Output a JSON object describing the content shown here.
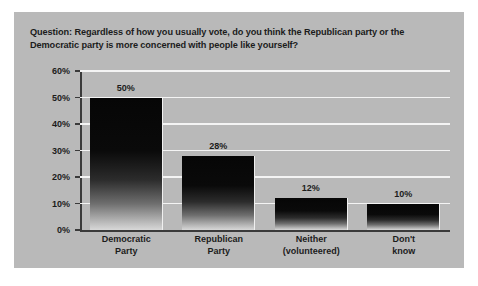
{
  "question": "Question: Regardless of how you usually vote, do you think the Republican party or the Democratic party is more concerned with people like yourself?",
  "colors": {
    "panel_background": "#b9b9b9",
    "gridline": "#f4f4f4",
    "axis": "#3a3a3a",
    "text": "#1c1c1c",
    "bar_top": "#060606",
    "bar_bottom": "#d8d8d8"
  },
  "chart_data": {
    "type": "bar",
    "title": "Question: Regardless of how you usually vote, do you think the Republican party or the Democratic party is more concerned with people like yourself?",
    "xlabel": "",
    "ylabel": "",
    "categories": [
      "Democratic\nParty",
      "Republican\nParty",
      "Neither\n(volunteered)",
      "Don't\nknow"
    ],
    "category_lines": [
      [
        "Democratic",
        "Party"
      ],
      [
        "Republican",
        "Party"
      ],
      [
        "Neither",
        "(volunteered)"
      ],
      [
        "Don't",
        "know"
      ]
    ],
    "values": [
      50,
      28,
      12,
      10
    ],
    "data_labels": [
      "50%",
      "28%",
      "12%",
      "10%"
    ],
    "ylim": [
      0,
      60
    ],
    "ytick_values": [
      0,
      10,
      20,
      30,
      40,
      50,
      60
    ],
    "ytick_labels": [
      "0%",
      "10%",
      "20%",
      "30%",
      "40%",
      "50%",
      "60%"
    ],
    "grid": true,
    "legend": false
  }
}
